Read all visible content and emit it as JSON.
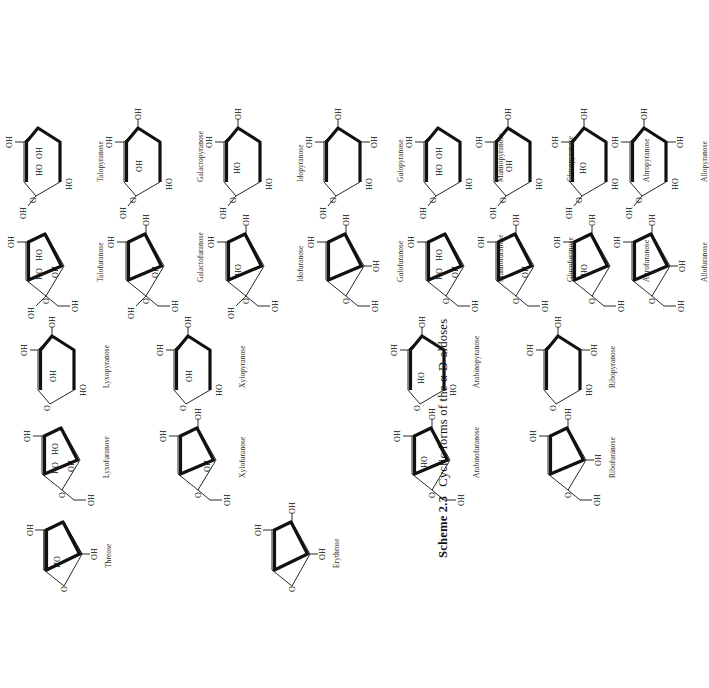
{
  "document": {
    "type": "book-page-scheme",
    "orientation": "rotated-90-ccw",
    "caption": {
      "number": "Scheme 2.3",
      "text": "Cyclic forms of the α-D-aldoses"
    }
  },
  "atoms": {
    "oh": "OH",
    "ho": "HO",
    "o": "O"
  },
  "structures": [
    {
      "id": "threose",
      "label": "Threose",
      "ring": "furanose",
      "generation": "tetrose",
      "column": 0,
      "row": 0,
      "substituents": [
        "OH",
        "HO",
        "OH"
      ]
    },
    {
      "id": "erythrose",
      "label": "Erythrose",
      "ring": "furanose",
      "generation": "tetrose",
      "column": 0,
      "row": 1,
      "substituents": [
        "OH",
        "OH",
        "OH"
      ]
    },
    {
      "id": "lyxofuranose",
      "label": "Lyxofuranose",
      "ring": "furanose",
      "generation": "pentose",
      "column": 1,
      "row": 0,
      "substituents": [
        "OH",
        "HO",
        "OH",
        "HO",
        "OH"
      ]
    },
    {
      "id": "xylofuranose",
      "label": "Xylofuranose",
      "ring": "furanose",
      "generation": "pentose",
      "column": 1,
      "row": 1,
      "substituents": [
        "OH",
        "OH",
        "OH",
        "OH"
      ]
    },
    {
      "id": "arabinofuranose",
      "label": "Arabinofuranose",
      "ring": "furanose",
      "generation": "pentose",
      "column": 1,
      "row": 2,
      "substituents": [
        "OH",
        "HO",
        "OH",
        "OH"
      ]
    },
    {
      "id": "ribofuranose",
      "label": "Ribofuranose",
      "ring": "furanose",
      "generation": "pentose",
      "column": 1,
      "row": 3,
      "substituents": [
        "OH",
        "OH",
        "OH",
        "OH"
      ]
    },
    {
      "id": "lyxopyranose",
      "label": "Lyxopyranose",
      "ring": "pyranose",
      "generation": "pentose",
      "column": 2,
      "row": 0,
      "substituents": [
        "OH",
        "OH",
        "OH",
        "HO"
      ]
    },
    {
      "id": "xylopyranose",
      "label": "Xylopyranose",
      "ring": "pyranose",
      "generation": "pentose",
      "column": 2,
      "row": 1,
      "substituents": [
        "OH",
        "OH",
        "OH",
        "HO"
      ]
    },
    {
      "id": "arabinopyranose",
      "label": "Arabinopyranose",
      "ring": "pyranose",
      "generation": "pentose",
      "column": 2,
      "row": 2,
      "substituents": [
        "OH",
        "HO",
        "OH",
        "HO"
      ]
    },
    {
      "id": "ribopyranose",
      "label": "Ribopyranose",
      "ring": "pyranose",
      "generation": "pentose",
      "column": 2,
      "row": 3,
      "substituents": [
        "OH",
        "OH",
        "OH",
        "HO"
      ]
    },
    {
      "id": "talofuranose",
      "label": "Talofuranose",
      "ring": "furanose",
      "generation": "hexose",
      "column": 3,
      "row": 0,
      "substituents": [
        "OH",
        "HO",
        "OH",
        "HO",
        "OH",
        "OH"
      ]
    },
    {
      "id": "galactofuranose",
      "label": "Galactofuranose",
      "ring": "furanose",
      "generation": "hexose",
      "column": 3,
      "row": 1,
      "substituents": [
        "OH",
        "OH",
        "OH",
        "HO",
        "OH",
        "OH"
      ]
    },
    {
      "id": "idofuranose",
      "label": "Idofuranose",
      "ring": "furanose",
      "generation": "hexose",
      "column": 3,
      "row": 2,
      "substituents": [
        "OH",
        "HO",
        "OH",
        "OH",
        "OH"
      ]
    },
    {
      "id": "gulofuranose",
      "label": "Gulofuranose",
      "ring": "furanose",
      "generation": "hexose",
      "column": 3,
      "row": 3,
      "substituents": [
        "OH",
        "OH",
        "OH",
        "OH"
      ]
    },
    {
      "id": "mannofuranose",
      "label": "Mannofuranose",
      "ring": "furanose",
      "generation": "hexose",
      "column": 3,
      "row": 4,
      "substituents": [
        "OH",
        "HO",
        "OH",
        "HO",
        "OH"
      ]
    },
    {
      "id": "glucofuranose",
      "label": "Glucofuranose",
      "ring": "furanose",
      "generation": "hexose",
      "column": 3,
      "row": 5,
      "substituents": [
        "OH",
        "OH",
        "OH",
        "HO",
        "OH"
      ]
    },
    {
      "id": "altrofuranose",
      "label": "Altrofuranose",
      "ring": "furanose",
      "generation": "hexose",
      "column": 3,
      "row": 6,
      "substituents": [
        "OH",
        "HO",
        "OH",
        "HO",
        "OH"
      ]
    },
    {
      "id": "allofuranose",
      "label": "Allofuranose",
      "ring": "furanose",
      "generation": "hexose",
      "column": 3,
      "row": 7,
      "substituents": [
        "OH",
        "OH",
        "OH",
        "OH",
        "OH"
      ]
    },
    {
      "id": "talopyranose",
      "label": "Talopyranose",
      "ring": "pyranose",
      "generation": "hexose",
      "column": 4,
      "row": 0,
      "substituents": [
        "OH",
        "HO",
        "OH",
        "HO",
        "OH"
      ]
    },
    {
      "id": "galactopyranose",
      "label": "Galactopyranose",
      "ring": "pyranose",
      "generation": "hexose",
      "column": 4,
      "row": 1,
      "substituents": [
        "OH",
        "OH",
        "OH",
        "HO",
        "OH"
      ]
    },
    {
      "id": "idopyranose",
      "label": "Idopyranose",
      "ring": "pyranose",
      "generation": "hexose",
      "column": 4,
      "row": 2,
      "substituents": [
        "OH",
        "HO",
        "OH",
        "HO",
        "OH"
      ]
    },
    {
      "id": "gulopyranose",
      "label": "Gulopyranose",
      "ring": "pyranose",
      "generation": "hexose",
      "column": 4,
      "row": 3,
      "substituents": [
        "OH",
        "OH",
        "OH",
        "HO",
        "OH"
      ]
    },
    {
      "id": "mannopyranose",
      "label": "Mannopyranose",
      "ring": "pyranose",
      "generation": "hexose",
      "column": 4,
      "row": 4,
      "substituents": [
        "OH",
        "HO",
        "OH",
        "HO",
        "OH"
      ]
    },
    {
      "id": "glucopyranose",
      "label": "Glucopyranose",
      "ring": "pyranose",
      "generation": "hexose",
      "column": 4,
      "row": 5,
      "substituents": [
        "OH",
        "OH",
        "OH",
        "HO",
        "OH"
      ]
    },
    {
      "id": "altropyranose",
      "label": "Altropyranose",
      "ring": "pyranose",
      "generation": "hexose",
      "column": 4,
      "row": 6,
      "substituents": [
        "OH",
        "HO",
        "OH",
        "HO",
        "OH"
      ]
    },
    {
      "id": "allopyranose",
      "label": "Allopyranose",
      "ring": "pyranose",
      "generation": "hexose",
      "column": 4,
      "row": 7,
      "substituents": [
        "OH",
        "OH",
        "OH",
        "HO",
        "OH"
      ]
    }
  ]
}
